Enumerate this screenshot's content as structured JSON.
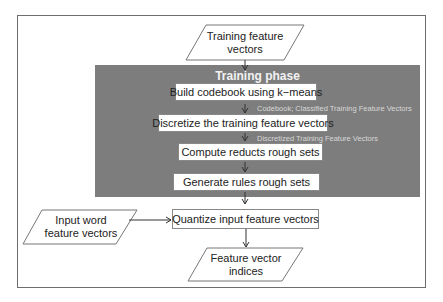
{
  "diagram": {
    "type": "flowchart",
    "inputs": {
      "training": "Training feature vectors",
      "training_lines": [
        "Training feature",
        "vectors"
      ],
      "word": "Input word feature vectors",
      "word_lines": [
        "Input word",
        "feature vectors"
      ]
    },
    "phase": {
      "title": "Training phase",
      "steps": [
        {
          "label": "Build codebook using k−means"
        },
        {
          "label": "Discretize the training feature vectors"
        },
        {
          "label": "Compute reducts rough sets"
        },
        {
          "label": "Generate rules rough sets"
        }
      ],
      "annotations": [
        "Codebook; Classified Training Feature Vectors",
        "Discretized  Training Feature Vectors"
      ]
    },
    "quantize": {
      "label": "Quantize input feature vectors"
    },
    "output": {
      "label": "Feature vector indices",
      "lines": [
        "Feature vector",
        "indices"
      ]
    },
    "colors": {
      "phase_bg": "#7d7d7d",
      "phase_title": "#f2f2f2",
      "annotation": "#d8d8d8",
      "border": "#6e6e6e"
    }
  }
}
